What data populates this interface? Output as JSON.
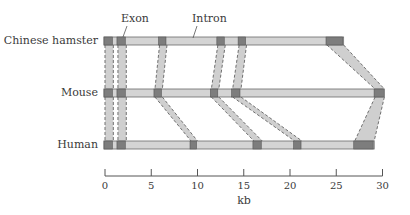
{
  "diagram": {
    "type": "gene-structure-comparison",
    "callouts": {
      "exon": "Exon",
      "intron": "Intron"
    },
    "species": [
      {
        "name": "Chinese hamster",
        "bar": [
          0,
          25.8
        ],
        "exons": [
          [
            0,
            0.9
          ],
          [
            1.4,
            2.3
          ],
          [
            5.9,
            6.7
          ],
          [
            12.2,
            13.0
          ],
          [
            14.5,
            15.3
          ],
          [
            24.0,
            25.8
          ]
        ]
      },
      {
        "name": "Mouse",
        "bar": [
          0,
          30.2
        ],
        "exons": [
          [
            0,
            0.9
          ],
          [
            1.4,
            2.3
          ],
          [
            5.4,
            6.2
          ],
          [
            11.5,
            12.3
          ],
          [
            13.8,
            14.7
          ],
          [
            29.2,
            30.2
          ]
        ]
      },
      {
        "name": "Human",
        "bar": [
          0,
          29.1
        ],
        "exons": [
          [
            0,
            0.9
          ],
          [
            1.4,
            2.3
          ],
          [
            9.3,
            10.0
          ],
          [
            16.1,
            17.0
          ],
          [
            20.5,
            21.3
          ],
          [
            27.0,
            29.1
          ]
        ]
      }
    ],
    "axis": {
      "title": "kb",
      "ticks": [
        0,
        5,
        10,
        15,
        20,
        25,
        30
      ],
      "tick_labels": [
        "0",
        "5",
        "10",
        "15",
        "20",
        "25",
        "30"
      ],
      "range": [
        0,
        30
      ]
    },
    "colors": {
      "intron_fill": "#d4d4d4",
      "intron_stroke": "#6a6a6a",
      "exon_fill": "#7d7d7d",
      "exon_stroke": "#555555",
      "connector_fill": "#cfcfcf",
      "connector_dash": "#707070",
      "text": "#3a3a3a"
    }
  }
}
